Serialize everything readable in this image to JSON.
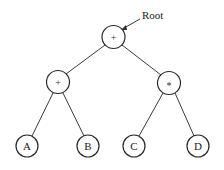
{
  "diagram": {
    "type": "expression-tree",
    "root_label": "Root",
    "nodes": [
      {
        "id": "root",
        "label": "+",
        "cx": 113.5,
        "cy": 37,
        "r": 11.5
      },
      {
        "id": "left",
        "label": "+",
        "cx": 58,
        "cy": 82,
        "r": 11.5
      },
      {
        "id": "right",
        "label": "*",
        "cx": 169,
        "cy": 83,
        "r": 11.5
      },
      {
        "id": "A",
        "label": "A",
        "cx": 27,
        "cy": 146,
        "r": 11
      },
      {
        "id": "B",
        "label": "B",
        "cx": 88,
        "cy": 146,
        "r": 11
      },
      {
        "id": "C",
        "label": "C",
        "cx": 134,
        "cy": 146,
        "r": 11
      },
      {
        "id": "D",
        "label": "D",
        "cx": 198,
        "cy": 146,
        "r": 11
      }
    ],
    "edges": [
      {
        "from": "root",
        "to": "left"
      },
      {
        "from": "root",
        "to": "right"
      },
      {
        "from": "left",
        "to": "A"
      },
      {
        "from": "left",
        "to": "B"
      },
      {
        "from": "right",
        "to": "C"
      },
      {
        "from": "right",
        "to": "D"
      }
    ],
    "colors": {
      "stroke": "#2a2a2a",
      "background": "#ffffff",
      "text": "#222222"
    }
  }
}
